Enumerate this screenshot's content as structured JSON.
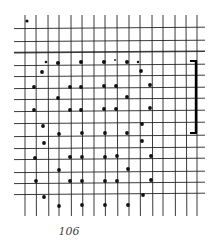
{
  "page": {
    "number_label": "106"
  },
  "figure": {
    "line_color": "#1a1a1a",
    "dot_color": "#111111",
    "grid": {
      "x_start": 14,
      "x_end": 205,
      "y_start": 15,
      "y_end": 216,
      "vertical_lines_x": [
        25,
        36,
        48,
        59,
        71,
        82,
        94,
        105,
        117,
        129,
        140,
        152,
        163,
        175,
        186,
        197
      ],
      "horizontal_lines_y": [
        28,
        41,
        52,
        65,
        76,
        88,
        99,
        111,
        123,
        136,
        148,
        159,
        172,
        183,
        194
      ],
      "thick_horizontal_index": 2
    },
    "bracket": {
      "x": 196,
      "y_top": 61,
      "y_bottom": 133,
      "tick_left_x": 190
    },
    "dots": [
      {
        "x": 27,
        "y": 21,
        "r": 1.6
      },
      {
        "x": 46,
        "y": 62,
        "r": 1.3
      },
      {
        "x": 58,
        "y": 63,
        "r": 2.0
      },
      {
        "x": 81,
        "y": 62,
        "r": 2.0
      },
      {
        "x": 104,
        "y": 62,
        "r": 2.0
      },
      {
        "x": 115,
        "y": 60,
        "r": 0.9
      },
      {
        "x": 127,
        "y": 62,
        "r": 2.0
      },
      {
        "x": 138,
        "y": 62,
        "r": 1.2
      },
      {
        "x": 42,
        "y": 72,
        "r": 1.9
      },
      {
        "x": 141,
        "y": 71,
        "r": 1.9
      },
      {
        "x": 34,
        "y": 87,
        "r": 1.9
      },
      {
        "x": 70,
        "y": 87,
        "r": 1.9
      },
      {
        "x": 81,
        "y": 87,
        "r": 1.9
      },
      {
        "x": 104,
        "y": 86,
        "r": 1.9
      },
      {
        "x": 116,
        "y": 86,
        "r": 1.9
      },
      {
        "x": 150,
        "y": 85,
        "r": 1.9
      },
      {
        "x": 58,
        "y": 98,
        "r": 1.9
      },
      {
        "x": 127,
        "y": 97,
        "r": 1.9
      },
      {
        "x": 34,
        "y": 110,
        "r": 1.9
      },
      {
        "x": 70,
        "y": 110,
        "r": 1.9
      },
      {
        "x": 81,
        "y": 110,
        "r": 1.9
      },
      {
        "x": 104,
        "y": 109,
        "r": 1.9
      },
      {
        "x": 116,
        "y": 109,
        "r": 1.9
      },
      {
        "x": 150,
        "y": 108,
        "r": 1.9
      },
      {
        "x": 43,
        "y": 126,
        "r": 1.9
      },
      {
        "x": 142,
        "y": 124,
        "r": 1.9
      },
      {
        "x": 59,
        "y": 134,
        "r": 1.9
      },
      {
        "x": 82,
        "y": 133,
        "r": 1.9
      },
      {
        "x": 105,
        "y": 133,
        "r": 1.9
      },
      {
        "x": 127,
        "y": 133,
        "r": 1.9
      },
      {
        "x": 44,
        "y": 143,
        "r": 1.9
      },
      {
        "x": 142,
        "y": 141,
        "r": 1.9
      },
      {
        "x": 35,
        "y": 158,
        "r": 1.9
      },
      {
        "x": 70,
        "y": 157,
        "r": 1.9
      },
      {
        "x": 82,
        "y": 157,
        "r": 1.9
      },
      {
        "x": 105,
        "y": 157,
        "r": 1.9
      },
      {
        "x": 117,
        "y": 156,
        "r": 1.9
      },
      {
        "x": 151,
        "y": 156,
        "r": 1.9
      },
      {
        "x": 59,
        "y": 170,
        "r": 1.9
      },
      {
        "x": 128,
        "y": 169,
        "r": 1.9
      },
      {
        "x": 36,
        "y": 181,
        "r": 1.9
      },
      {
        "x": 70,
        "y": 181,
        "r": 1.9
      },
      {
        "x": 82,
        "y": 181,
        "r": 1.9
      },
      {
        "x": 105,
        "y": 181,
        "r": 1.9
      },
      {
        "x": 117,
        "y": 181,
        "r": 1.9
      },
      {
        "x": 151,
        "y": 180,
        "r": 1.9
      },
      {
        "x": 44,
        "y": 197,
        "r": 1.9
      },
      {
        "x": 143,
        "y": 195,
        "r": 1.9
      },
      {
        "x": 59,
        "y": 206,
        "r": 1.9
      },
      {
        "x": 82,
        "y": 205,
        "r": 1.9
      },
      {
        "x": 105,
        "y": 205,
        "r": 1.9
      },
      {
        "x": 128,
        "y": 205,
        "r": 1.9
      }
    ]
  }
}
